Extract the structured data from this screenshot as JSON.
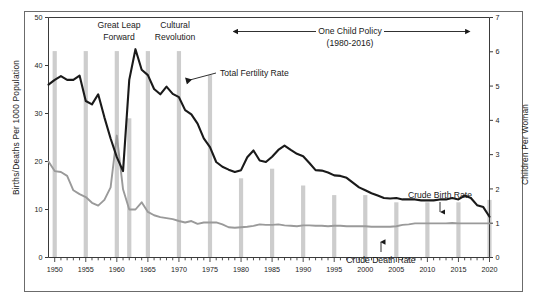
{
  "chart_data": {
    "type": "line",
    "title": "",
    "xlabel": "",
    "ylabel": "Births/Deaths Per 1000 Population",
    "y2label": "Children Per Woman",
    "xlim": [
      1949,
      2020
    ],
    "ylim": [
      0,
      50
    ],
    "y2lim": [
      0,
      7
    ],
    "grid": false,
    "legend_position": "inline-annotations",
    "y_ticks": [
      0,
      10,
      20,
      30,
      40,
      50
    ],
    "y2_ticks": [
      0,
      1,
      2,
      3,
      4,
      5,
      6,
      7
    ],
    "x_ticks": [
      1950,
      1955,
      1960,
      1965,
      1970,
      1975,
      1980,
      1985,
      1990,
      1995,
      2000,
      2005,
      2010,
      2015,
      2020
    ],
    "x_minor_tick_interval": 1,
    "series": [
      {
        "name": "Crude Birth Rate",
        "color": "#1a1a1a",
        "axis": "left",
        "unit": "per 1000 population",
        "x": [
          1949,
          1950,
          1951,
          1952,
          1953,
          1954,
          1955,
          1956,
          1957,
          1958,
          1959,
          1960,
          1961,
          1962,
          1963,
          1964,
          1965,
          1966,
          1967,
          1968,
          1969,
          1970,
          1971,
          1972,
          1973,
          1974,
          1975,
          1976,
          1977,
          1978,
          1979,
          1980,
          1981,
          1982,
          1983,
          1984,
          1985,
          1986,
          1987,
          1988,
          1989,
          1990,
          1991,
          1992,
          1993,
          1994,
          1995,
          1996,
          1997,
          1998,
          1999,
          2000,
          2001,
          2002,
          2003,
          2004,
          2005,
          2006,
          2007,
          2008,
          2009,
          2010,
          2011,
          2012,
          2013,
          2014,
          2015,
          2016,
          2017,
          2018,
          2019,
          2020
        ],
        "y": [
          36.0,
          37.0,
          37.8,
          37.0,
          37.0,
          37.9,
          32.6,
          31.9,
          34.0,
          29.2,
          24.8,
          20.9,
          18.0,
          37.0,
          43.4,
          39.1,
          38.0,
          35.1,
          34.0,
          35.6,
          34.1,
          33.4,
          30.7,
          29.8,
          27.9,
          24.8,
          23.0,
          19.9,
          18.9,
          18.3,
          17.8,
          18.2,
          20.9,
          22.3,
          20.2,
          19.9,
          21.0,
          22.4,
          23.3,
          22.4,
          21.6,
          21.1,
          19.7,
          18.2,
          18.1,
          17.7,
          17.1,
          17.0,
          16.6,
          15.6,
          14.6,
          14.0,
          13.4,
          12.9,
          12.4,
          12.3,
          12.4,
          12.1,
          12.1,
          12.1,
          11.9,
          11.9,
          11.9,
          12.1,
          12.1,
          12.4,
          12.1,
          12.9,
          12.4,
          10.9,
          10.5,
          8.5
        ]
      },
      {
        "name": "Crude Death Rate",
        "color": "#9a9a9a",
        "axis": "left",
        "unit": "per 1000 population",
        "x": [
          1949,
          1950,
          1951,
          1952,
          1953,
          1954,
          1955,
          1956,
          1957,
          1958,
          1959,
          1960,
          1961,
          1962,
          1963,
          1964,
          1965,
          1966,
          1967,
          1968,
          1969,
          1970,
          1971,
          1972,
          1973,
          1974,
          1975,
          1976,
          1977,
          1978,
          1979,
          1980,
          1981,
          1982,
          1983,
          1984,
          1985,
          1986,
          1987,
          1988,
          1989,
          1990,
          1991,
          1992,
          1993,
          1994,
          1995,
          1996,
          1997,
          1998,
          1999,
          2000,
          2001,
          2002,
          2003,
          2004,
          2005,
          2006,
          2007,
          2008,
          2009,
          2010,
          2011,
          2012,
          2013,
          2014,
          2015,
          2016,
          2017,
          2018,
          2019,
          2020
        ],
        "y": [
          20.0,
          18.0,
          17.8,
          17.0,
          14.0,
          13.2,
          12.6,
          11.4,
          10.8,
          12.0,
          14.6,
          25.4,
          14.2,
          10.0,
          10.0,
          11.5,
          9.5,
          8.8,
          8.4,
          8.2,
          8.0,
          7.6,
          7.3,
          7.6,
          7.0,
          7.3,
          7.3,
          7.3,
          6.9,
          6.3,
          6.2,
          6.3,
          6.4,
          6.6,
          6.9,
          6.8,
          6.8,
          6.9,
          6.7,
          6.6,
          6.5,
          6.7,
          6.7,
          6.6,
          6.6,
          6.5,
          6.6,
          6.6,
          6.5,
          6.5,
          6.5,
          6.5,
          6.4,
          6.4,
          6.4,
          6.4,
          6.5,
          6.8,
          6.9,
          7.1,
          7.1,
          7.1,
          7.1,
          7.1,
          7.1,
          7.2,
          7.1,
          7.1,
          7.1,
          7.1,
          7.1,
          7.1
        ]
      },
      {
        "name": "Total Fertility Rate",
        "color": "#1a1a1a",
        "axis": "right",
        "unit": "children per woman",
        "note": "same drawn curve as crude birth rate line, read against right-hand axis"
      }
    ],
    "bars": {
      "name": "5-year interval bars",
      "color": "#cdcdcd",
      "axis": "left",
      "years": [
        1950,
        1955,
        1960,
        1962,
        1965,
        1970,
        1975,
        1980,
        1985,
        1990,
        1995,
        2000,
        2005,
        2010,
        2015,
        2020
      ],
      "values": [
        43.0,
        43.0,
        43.0,
        29.0,
        43.0,
        43.0,
        38.0,
        16.5,
        18.5,
        15.0,
        13.0,
        13.0,
        11.5,
        11.5,
        11.5,
        12.0
      ]
    },
    "annotations": [
      {
        "id": "great-leap-forward",
        "text_line1": "Great Leap",
        "text_line2": "Forward",
        "year": 1958
      },
      {
        "id": "cultural-revolution",
        "text_line1": "Cultural",
        "text_line2": "Revolution",
        "year": 1966
      },
      {
        "id": "one-child-policy",
        "text_line1": "One Child Policy",
        "text_line2": "(1980-2016)",
        "year_start": 1980,
        "year_end": 2016,
        "arrow": "double"
      },
      {
        "id": "total-fertility-rate",
        "text": "Total Fertility Rate",
        "arrow": "left"
      },
      {
        "id": "crude-birth-rate",
        "text": "Crude Birth Rate",
        "arrow": "down"
      },
      {
        "id": "crude-death-rate",
        "text": "Crude Death Rate",
        "arrow": "up"
      }
    ],
    "colors": {
      "birth_line": "#1a1a1a",
      "death_line": "#9a9a9a",
      "bars": "#cdcdcd",
      "frame": "#6b6b6b",
      "axis": "#3a3a3a",
      "background": "#ffffff"
    }
  }
}
